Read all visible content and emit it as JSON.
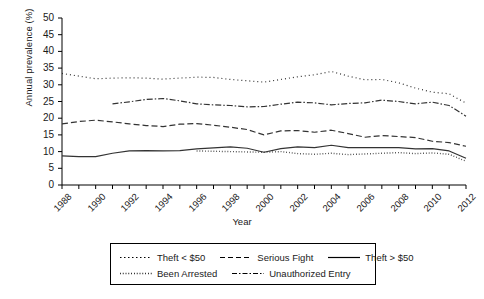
{
  "chart_data": {
    "type": "line",
    "title": "",
    "xlabel": "Year",
    "ylabel": "Annual prevalence (%)",
    "xlim": [
      1988,
      2012
    ],
    "ylim": [
      0,
      50
    ],
    "ytick_step": 5,
    "xtick_step": 2,
    "grid": false,
    "legend_position": "bottom",
    "yticks": [
      "50",
      "45",
      "40",
      "35",
      "30",
      "25",
      "20",
      "15",
      "10",
      "5",
      "0"
    ],
    "xticks": [
      "1988",
      "1990",
      "1992",
      "1994",
      "1996",
      "1998",
      "2000",
      "2002",
      "2004",
      "2006",
      "2008",
      "2010",
      "2012"
    ],
    "x": [
      1988,
      1989,
      1990,
      1991,
      1992,
      1993,
      1994,
      1995,
      1996,
      1997,
      1998,
      1999,
      2000,
      2001,
      2002,
      2003,
      2004,
      2005,
      2006,
      2007,
      2008,
      2009,
      2010,
      2011,
      2012
    ],
    "series": [
      {
        "name": "Theft < $50",
        "dash": "1,3",
        "width": 1.2,
        "color": "#333333",
        "x": [
          1988,
          1989,
          1990,
          1991,
          1992,
          1993,
          1994,
          1995,
          1996,
          1997,
          1998,
          1999,
          2000,
          2001,
          2002,
          2003,
          2004,
          2005,
          2006,
          2007,
          2008,
          2009,
          2010,
          2011,
          2012
        ],
        "values": [
          33.4,
          32.6,
          31.8,
          32.0,
          32.1,
          32.0,
          31.7,
          32.0,
          32.3,
          32.2,
          31.6,
          31.2,
          30.8,
          31.6,
          32.4,
          33.0,
          34.0,
          32.6,
          31.5,
          31.6,
          30.6,
          29.0,
          27.8,
          27.3,
          24.5
        ]
      },
      {
        "name": "Serious Fight",
        "dash": "6,3",
        "width": 1.2,
        "color": "#333333",
        "x": [
          1988,
          1989,
          1990,
          1991,
          1992,
          1993,
          1994,
          1995,
          1996,
          1997,
          1998,
          1999,
          2000,
          2001,
          2002,
          2003,
          2004,
          2005,
          2006,
          2007,
          2008,
          2009,
          2010,
          2011,
          2012
        ],
        "values": [
          18.3,
          19.0,
          19.4,
          18.9,
          18.3,
          17.8,
          17.5,
          18.2,
          18.4,
          17.9,
          17.3,
          16.6,
          15.0,
          16.2,
          16.3,
          15.8,
          16.4,
          15.4,
          14.3,
          14.8,
          14.5,
          14.2,
          13.1,
          12.7,
          11.6
        ]
      },
      {
        "name": "Theft > $50",
        "dash": "none",
        "width": 1.2,
        "color": "#333333",
        "x": [
          1988,
          1989,
          1990,
          1991,
          1992,
          1993,
          1994,
          1995,
          1996,
          1997,
          1998,
          1999,
          2000,
          2001,
          2002,
          2003,
          2004,
          2005,
          2006,
          2007,
          2008,
          2009,
          2010,
          2011,
          2012
        ],
        "values": [
          8.7,
          8.5,
          8.5,
          9.5,
          10.2,
          10.3,
          10.2,
          10.3,
          10.8,
          11.1,
          11.4,
          11.0,
          9.8,
          10.9,
          11.4,
          11.2,
          11.9,
          11.2,
          11.2,
          11.2,
          11.2,
          10.8,
          10.9,
          10.2,
          8.0
        ]
      },
      {
        "name": "Been Arrested",
        "dash": "0.8,2",
        "width": 1.4,
        "color": "#333333",
        "x": [
          1996,
          1997,
          1998,
          1999,
          2000,
          2001,
          2002,
          2003,
          2004,
          2005,
          2006,
          2007,
          2008,
          2009,
          2010,
          2011,
          2012
        ],
        "values": [
          10.2,
          10.1,
          10.0,
          9.9,
          9.8,
          10.0,
          9.4,
          9.2,
          9.5,
          9.1,
          9.3,
          9.5,
          9.7,
          9.4,
          9.6,
          9.2,
          7.1
        ]
      },
      {
        "name": "Unauthorized Entry",
        "dash": "6,2,1.5,2",
        "width": 1.2,
        "color": "#333333",
        "x": [
          1991,
          1992,
          1993,
          1994,
          1995,
          1996,
          1997,
          1998,
          1999,
          2000,
          2001,
          2002,
          2003,
          2004,
          2005,
          2006,
          2007,
          2008,
          2009,
          2010,
          2011,
          2012
        ],
        "values": [
          24.3,
          24.9,
          25.6,
          25.9,
          25.2,
          24.3,
          24.0,
          23.8,
          23.4,
          23.5,
          24.2,
          24.8,
          24.6,
          24.0,
          24.4,
          24.6,
          25.4,
          25.0,
          24.3,
          24.8,
          23.8,
          20.6
        ]
      }
    ]
  },
  "legend": {
    "rows": [
      [
        {
          "label": "Theft < $50",
          "key": "dotted-coarse"
        },
        {
          "label": "Serious Fight",
          "key": "dashed"
        },
        {
          "label": "Theft > $50",
          "key": "solid"
        }
      ],
      [
        {
          "label": "Been Arrested",
          "key": "dotted-fine"
        },
        {
          "label": "Unauthorized Entry",
          "key": "dash-dot"
        }
      ]
    ]
  }
}
